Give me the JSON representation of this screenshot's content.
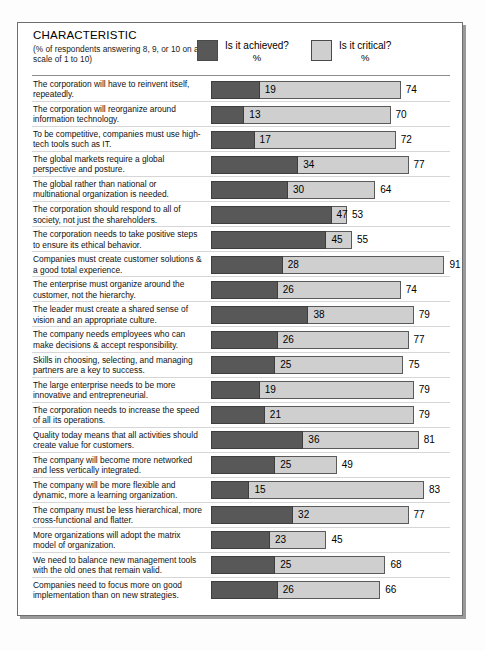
{
  "header": {
    "title": "CHARACTERISTIC",
    "subtitle": "(% of respondents answering 8, 9, or 10 on a scale of 1 to 10)",
    "legend": [
      {
        "label": "Is it achieved?",
        "unit": "%",
        "color": "#585858",
        "key": "achieved"
      },
      {
        "label": "Is it critical?",
        "unit": "%",
        "color": "#cfcfcf",
        "key": "critical"
      }
    ]
  },
  "chart_data": {
    "type": "bar",
    "title": "CHARACTERISTIC",
    "subtitle": "(% of respondents answering 8, 9, or 10 on a scale of 1 to 10)",
    "xlabel": "%",
    "ylabel": "",
    "xlim": [
      0,
      100
    ],
    "grid": false,
    "legend_position": "top",
    "series": [
      {
        "name": "Is it achieved?",
        "color": "#585858",
        "values": [
          19,
          13,
          17,
          34,
          30,
          47,
          45,
          28,
          26,
          38,
          26,
          25,
          19,
          21,
          36,
          25,
          15,
          32,
          23,
          25,
          26
        ]
      },
      {
        "name": "Is it critical?",
        "color": "#cfcfcf",
        "values": [
          74,
          70,
          72,
          77,
          64,
          53,
          55,
          91,
          74,
          79,
          77,
          75,
          79,
          79,
          81,
          49,
          83,
          77,
          45,
          68,
          66
        ]
      }
    ],
    "categories": [
      "The corporation will have to reinvent itself, repeatedly.",
      "The corporation will reorganize around information technology.",
      "To be competitive, companies must use high-tech tools such as IT.",
      "The global markets require a global perspective and posture.",
      "The global rather than national or multinational organization is needed.",
      "The corporation should respond to all of society, not just the shareholders.",
      "The corporation needs to take positive steps to ensure its ethical behavior.",
      "Companies must create customer solutions & a good total experience.",
      "The enterprise must organize around the customer, not the hierarchy.",
      "The leader must create a shared sense of vision and an appropriate culture.",
      "The company needs employees who can make decisions & accept responsibility.",
      "Skills in choosing, selecting, and managing partners are a key to success.",
      "The large enterprise needs to be more innovative and entrepreneurial.",
      "The corporation needs to increase the speed of all its operations.",
      "Quality today means that all activities should create value for customers.",
      "The company will become more networked and less vertically integrated.",
      "The company will be more flexible and dynamic, more a learning organization.",
      "The company must be less hierarchical, more cross-functional and flatter.",
      "More organizations will adopt the matrix model of organization.",
      "We need to balance new management tools with the old ones that remain valid.",
      "Companies need to focus more on good implementation than on new strategies."
    ]
  },
  "rows": [
    {
      "label": "The corporation will have to reinvent itself, repeatedly.",
      "achieved": 19,
      "critical": 74
    },
    {
      "label": "The corporation will reorganize around information technology.",
      "achieved": 13,
      "critical": 70
    },
    {
      "label": "To be competitive, companies must use high-tech tools such as IT.",
      "achieved": 17,
      "critical": 72
    },
    {
      "label": "The global markets require a global perspective and posture.",
      "achieved": 34,
      "critical": 77
    },
    {
      "label": "The global rather than national or multinational organization is needed.",
      "achieved": 30,
      "critical": 64
    },
    {
      "label": "The corporation should respond to all of society, not just the shareholders.",
      "achieved": 47,
      "critical": 53
    },
    {
      "label": "The corporation needs to take positive steps to ensure its ethical behavior.",
      "achieved": 45,
      "critical": 55
    },
    {
      "label": "Companies must create customer solutions & a good total experience.",
      "achieved": 28,
      "critical": 91
    },
    {
      "label": "The enterprise must organize around the customer, not the hierarchy.",
      "achieved": 26,
      "critical": 74
    },
    {
      "label": "The leader must create a shared sense of vision and an appropriate culture.",
      "achieved": 38,
      "critical": 79
    },
    {
      "label": "The company needs employees who can make decisions & accept responsibility.",
      "achieved": 26,
      "critical": 77
    },
    {
      "label": "Skills in choosing, selecting, and managing partners are a key to success.",
      "achieved": 25,
      "critical": 75
    },
    {
      "label": "The large enterprise needs to be more innovative and entrepreneurial.",
      "achieved": 19,
      "critical": 79
    },
    {
      "label": "The corporation needs to increase the speed of all its operations.",
      "achieved": 21,
      "critical": 79
    },
    {
      "label": "Quality today means that all activities should create value for customers.",
      "achieved": 36,
      "critical": 81
    },
    {
      "label": "The company will become more networked and less vertically integrated.",
      "achieved": 25,
      "critical": 49
    },
    {
      "label": "The company will be more flexible and dynamic, more a learning organization.",
      "achieved": 15,
      "critical": 83
    },
    {
      "label": "The company must be less hierarchical, more cross-functional and flatter.",
      "achieved": 32,
      "critical": 77
    },
    {
      "label": "More organizations will adopt the matrix model of organization.",
      "achieved": 23,
      "critical": 45
    },
    {
      "label": "We need to balance new management tools with the old ones that remain valid.",
      "achieved": 25,
      "critical": 68
    },
    {
      "label": "Companies need to focus more on good implementation than on new strategies.",
      "achieved": 26,
      "critical": 66
    }
  ]
}
